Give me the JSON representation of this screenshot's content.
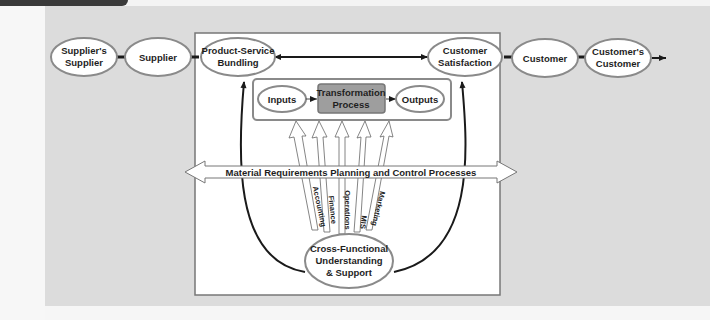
{
  "diagram": {
    "supply_chain": {
      "suppliers_supplier": [
        "Supplier's",
        "Supplier"
      ],
      "supplier": "Supplier",
      "product_service_bundling": [
        "Product-Service",
        "Bundling"
      ],
      "customer_satisfaction": [
        "Customer",
        "Satisfaction"
      ],
      "customer": "Customer",
      "customers_customer": [
        "Customer's",
        "Customer"
      ]
    },
    "process": {
      "inputs": "Inputs",
      "transformation": [
        "Transformation",
        "Process"
      ],
      "outputs": "Outputs"
    },
    "mrp_banner": "Material Requirements Planning and Control Processes",
    "functions": [
      "Accounting",
      "Finance",
      "Operations",
      "MIS",
      "Marketing"
    ],
    "cross_functional": [
      "Cross-Functional",
      "Understanding",
      "& Support"
    ]
  },
  "colors": {
    "panel_background": "#dcdcdc",
    "inner_box": "#ffffff",
    "ellipse_stroke": "#8a8a8a",
    "transformation_fill": "#9e9e9e",
    "line": "#1a1a1a"
  }
}
